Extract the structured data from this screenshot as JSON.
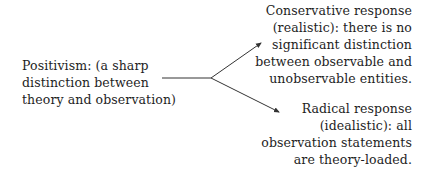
{
  "diagram": {
    "type": "branching-argument",
    "source": {
      "lines": [
        "Positivism: (a sharp",
        "distinction between",
        "theory and observation)"
      ]
    },
    "branches": [
      {
        "name": "conservative-response",
        "lines": [
          "Conservative response",
          "(realistic): there is no",
          "significant distinction",
          "between observable and",
          "unobservable entities."
        ]
      },
      {
        "name": "radical-response",
        "lines": [
          "Radical response",
          "(idealistic): all",
          "observation statements",
          "are theory-loaded."
        ]
      }
    ],
    "colors": {
      "text": "#1e1e1e",
      "line": "#333333",
      "background": "#ffffff"
    }
  }
}
